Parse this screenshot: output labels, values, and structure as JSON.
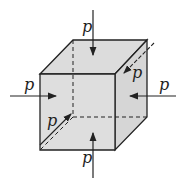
{
  "diagram": {
    "face_color": "#dcdcdc",
    "line_color": "#222222",
    "labels": {
      "top": "p",
      "left": "p",
      "right": "p",
      "bottom": "p",
      "front": "p",
      "back": "p"
    }
  }
}
